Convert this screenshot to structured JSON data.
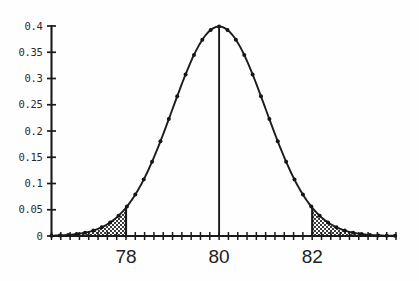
{
  "chart_data": {
    "type": "line",
    "title": "",
    "subtitle": "",
    "xlabel": "",
    "ylabel": "",
    "distribution": {
      "name": "normal",
      "mean": 80,
      "std_dev": 1,
      "peak_value": 0.4
    },
    "xlim": [
      76.4,
      83.8
    ],
    "ylim": [
      0,
      0.4
    ],
    "grid": false,
    "legend": null,
    "markers": "filled-circle",
    "x_tick_labels": [
      "78",
      "80",
      "82"
    ],
    "x_tick_values": [
      78,
      80,
      82
    ],
    "y_tick_labels": [
      "0",
      "0.05",
      "0.1",
      "0.15",
      "0.2",
      "0.25",
      "0.3",
      "0.35",
      "0.4"
    ],
    "y_tick_values": [
      0,
      0.05,
      0.1,
      0.15,
      0.2,
      0.25,
      0.3,
      0.35,
      0.4
    ],
    "x_minor_tick_step": 0.2,
    "annotations": [
      {
        "name": "center-line",
        "x": 80,
        "y_from": 0,
        "y_to": 0.4
      },
      {
        "name": "left-boundary-line",
        "x": 78,
        "y_from": 0,
        "y_to": 0.054
      },
      {
        "name": "right-boundary-line",
        "x": 82,
        "y_from": 0,
        "y_to": 0.054
      }
    ],
    "shaded_regions": [
      {
        "name": "left-tail",
        "x_from": 76.4,
        "x_to": 78,
        "fill": "stipple"
      },
      {
        "name": "right-tail",
        "x_from": 82,
        "x_to": 83.8,
        "fill": "stipple"
      }
    ],
    "x": [
      76.4,
      76.6,
      76.8,
      77.0,
      77.2,
      77.4,
      77.6,
      77.8,
      78.0,
      78.2,
      78.4,
      78.6,
      78.8,
      79.0,
      79.2,
      79.4,
      79.6,
      79.8,
      80.0,
      80.2,
      80.4,
      80.6,
      80.8,
      81.0,
      81.2,
      81.4,
      81.6,
      81.8,
      82.0,
      82.2,
      82.4,
      82.6,
      82.8,
      83.0,
      83.2,
      83.4,
      83.6,
      83.8
    ],
    "y": [
      0.0039,
      0.0063,
      0.0099,
      0.0151,
      0.0224,
      0.0325,
      0.0459,
      0.0632,
      0.054,
      0.1109,
      0.1435,
      0.1804,
      0.2203,
      0.2613,
      0.3011,
      0.3332,
      0.3683,
      0.391,
      0.3989,
      0.391,
      0.3683,
      0.3332,
      0.3011,
      0.2613,
      0.2203,
      0.1804,
      0.1435,
      0.1109,
      0.054,
      0.0632,
      0.0459,
      0.0325,
      0.0224,
      0.0151,
      0.0099,
      0.0063,
      0.0039,
      0.0024
    ]
  },
  "colors": {
    "background": "#fefefe",
    "axis": "#1a1a1a",
    "curve": "#1c1c1c",
    "label": "#222222",
    "shade_fill": "#d8d8d8"
  }
}
